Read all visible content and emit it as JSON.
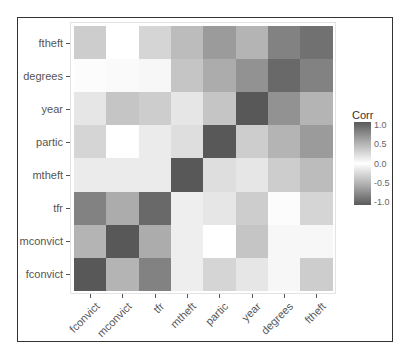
{
  "chart_data": {
    "type": "heatmap",
    "title": "",
    "xlabel": "",
    "ylabel": "",
    "x_categories": [
      "fconvict",
      "mconvict",
      "tfr",
      "mtheft",
      "partic",
      "year",
      "degrees",
      "ftheft"
    ],
    "y_categories_top_to_bottom": [
      "ftheft",
      "degrees",
      "year",
      "partic",
      "mtheft",
      "tfr",
      "mconvict",
      "fconvict"
    ],
    "values_top_to_bottom": [
      [
        0.3,
        0.0,
        0.25,
        0.4,
        0.6,
        0.45,
        0.75,
        0.85
      ],
      [
        0.02,
        0.03,
        0.05,
        0.35,
        0.5,
        0.65,
        0.9,
        0.75
      ],
      [
        -0.15,
        -0.35,
        -0.3,
        0.15,
        0.35,
        1.0,
        0.65,
        0.45
      ],
      [
        -0.25,
        0.0,
        -0.12,
        0.2,
        1.0,
        0.3,
        0.45,
        0.6
      ],
      [
        -0.12,
        -0.12,
        -0.12,
        1.0,
        0.2,
        0.15,
        0.3,
        0.4
      ],
      [
        -0.75,
        -0.5,
        -0.9,
        -0.1,
        -0.15,
        -0.3,
        0.02,
        -0.25
      ],
      [
        -0.45,
        1.0,
        -0.5,
        -0.1,
        0.0,
        -0.35,
        0.05,
        0.05
      ],
      [
        1.0,
        -0.45,
        -0.75,
        -0.1,
        -0.25,
        -0.15,
        0.05,
        -0.3
      ]
    ],
    "legend": {
      "title": "Corr",
      "ticks": [
        "1.0",
        "0.5",
        "0.0",
        "-0.5",
        "-1.0"
      ],
      "range": [
        -1,
        1
      ]
    },
    "grid": false,
    "legend_position": "right"
  },
  "legend": {
    "title": "Corr",
    "ticks": [
      "1.0",
      "0.5",
      "0.0",
      "-0.5",
      "-1.0"
    ]
  },
  "colors": {
    "high": "#575757",
    "mid": "#ffffff",
    "low": "#595959"
  }
}
